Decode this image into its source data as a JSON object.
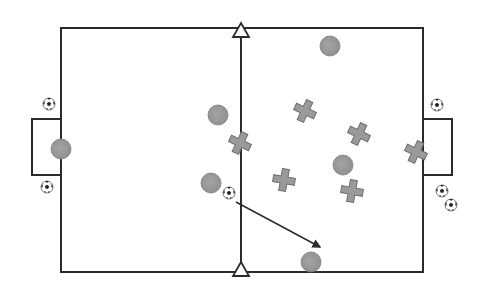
{
  "diagram": {
    "type": "soccer-drill",
    "colors": {
      "line": "#2b2b2b",
      "player_fill": "#9a9a9a",
      "player_stroke": "#7d7d7d",
      "cone_fill": "#ffffff",
      "background": "#ffffff"
    },
    "field": {
      "x1": 61,
      "y1": 28,
      "x2": 423,
      "y2": 272,
      "halfway_x": 241
    },
    "goals": [
      {
        "side": "left",
        "x": 32,
        "y": 119,
        "w": 29,
        "h": 56
      },
      {
        "side": "right",
        "x": 423,
        "y": 119,
        "w": 29,
        "h": 56
      }
    ],
    "cones": [
      {
        "id": "cone-top",
        "x": 241,
        "y": 31
      },
      {
        "id": "cone-bottom",
        "x": 241,
        "y": 270
      }
    ],
    "circle_players": [
      {
        "x": 330,
        "y": 46
      },
      {
        "x": 218,
        "y": 115
      },
      {
        "x": 61,
        "y": 149
      },
      {
        "x": 211,
        "y": 183
      },
      {
        "x": 343,
        "y": 165
      },
      {
        "x": 311,
        "y": 262
      }
    ],
    "cross_players": [
      {
        "x": 240,
        "y": 143,
        "rot": 25
      },
      {
        "x": 305,
        "y": 111,
        "rot": 25
      },
      {
        "x": 359,
        "y": 134,
        "rot": 25
      },
      {
        "x": 284,
        "y": 180,
        "rot": 10
      },
      {
        "x": 352,
        "y": 191,
        "rot": 10
      },
      {
        "x": 416,
        "y": 152,
        "rot": 25
      }
    ],
    "balls": [
      {
        "x": 49,
        "y": 104
      },
      {
        "x": 47,
        "y": 187
      },
      {
        "x": 437,
        "y": 105
      },
      {
        "x": 442,
        "y": 191
      },
      {
        "x": 451,
        "y": 205
      },
      {
        "x": 229,
        "y": 193
      }
    ],
    "arrows": [
      {
        "x1": 236,
        "y1": 202,
        "x2": 320,
        "y2": 247
      }
    ]
  }
}
